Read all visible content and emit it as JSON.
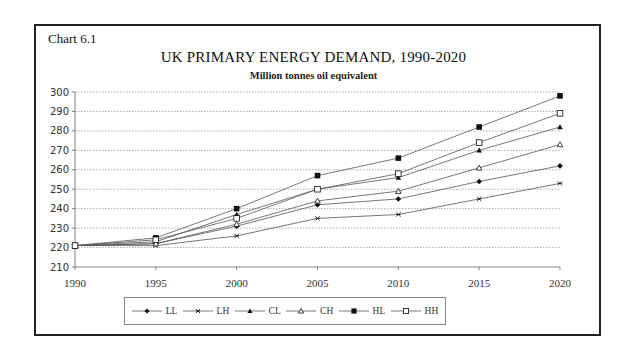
{
  "chart_label": "Chart 6.1",
  "title": "UK PRIMARY ENERGY DEMAND, 1990-2020",
  "subtitle": "Million tonnes oil equivalent",
  "chart_data": {
    "type": "line",
    "title": "UK PRIMARY ENERGY DEMAND, 1990-2020",
    "subtitle": "Million tonnes oil equivalent",
    "xlabel": "",
    "ylabel": "Million tonnes oil equivalent",
    "x": [
      1990,
      1995,
      2000,
      2005,
      2010,
      2015,
      2020
    ],
    "ylim": [
      210,
      300
    ],
    "yticks": [
      210,
      220,
      230,
      240,
      250,
      260,
      270,
      280,
      290,
      300
    ],
    "grid": true,
    "legend_position": "bottom",
    "series": [
      {
        "name": "LL",
        "marker": "diamond-filled",
        "values": [
          221,
          222,
          231,
          242,
          245,
          254,
          262
        ]
      },
      {
        "name": "LH",
        "marker": "x",
        "values": [
          221,
          221,
          226,
          235,
          237,
          245,
          253
        ]
      },
      {
        "name": "CL",
        "marker": "triangle-filled",
        "values": [
          221,
          223,
          237,
          250,
          256,
          270,
          282
        ]
      },
      {
        "name": "CH",
        "marker": "triangle-open",
        "values": [
          221,
          222,
          232,
          244,
          249,
          261,
          273
        ]
      },
      {
        "name": "HL",
        "marker": "square-filled",
        "values": [
          221,
          225,
          240,
          257,
          266,
          282,
          298
        ]
      },
      {
        "name": "HH",
        "marker": "square-open",
        "values": [
          221,
          224,
          235,
          250,
          258,
          274,
          289
        ]
      }
    ]
  },
  "colors": {
    "line": "#555555",
    "marker": "#111111",
    "grid": "#999999",
    "border": "#222222"
  }
}
